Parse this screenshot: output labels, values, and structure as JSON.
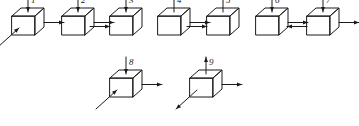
{
  "figure": {
    "background_color": "#ffffff",
    "stroke_color": "#1a1a1a",
    "cube_count": 9,
    "rows": [
      {
        "name": "top-row",
        "cube_indices": [
          0,
          1,
          2,
          3,
          4,
          5,
          6
        ]
      },
      {
        "name": "bottom-row",
        "cube_indices": [
          7,
          8
        ]
      }
    ]
  },
  "cubes": [
    {
      "label": "1",
      "row": "top",
      "position": {
        "x": 12,
        "y": 16
      },
      "top_arrow": {
        "direction": "down",
        "label": "1"
      },
      "right_arrow": {
        "present": true,
        "direction": "out-right"
      },
      "left_arrow": {
        "present": false
      },
      "diagonal_arrow": {
        "present": true,
        "direction": "in-from-lower-left"
      }
    },
    {
      "label": "2",
      "row": "top",
      "position": {
        "x": 62,
        "y": 16
      },
      "top_arrow": {
        "direction": "down",
        "label": "2"
      },
      "right_arrow": {
        "present": true,
        "direction": "out-right"
      },
      "left_arrow": {
        "present": false
      },
      "diagonal_arrow": {
        "present": false
      }
    },
    {
      "label": "3",
      "row": "top",
      "position": {
        "x": 110,
        "y": 16
      },
      "top_arrow": {
        "direction": "down",
        "label": "3"
      },
      "right_arrow": {
        "present": false
      },
      "left_arrow": {
        "present": true,
        "direction": "in-from-left"
      },
      "diagonal_arrow": {
        "present": false
      }
    },
    {
      "label": "4",
      "row": "top",
      "position": {
        "x": 158,
        "y": 16
      },
      "top_arrow": {
        "direction": "up",
        "label": "4"
      },
      "right_arrow": {
        "present": true,
        "direction": "out-right"
      },
      "left_arrow": {
        "present": false
      },
      "diagonal_arrow": {
        "present": false
      }
    },
    {
      "label": "5",
      "row": "top",
      "position": {
        "x": 207,
        "y": 16
      },
      "top_arrow": {
        "direction": "up",
        "label": "5"
      },
      "right_arrow": {
        "present": false
      },
      "left_arrow": {
        "present": true,
        "direction": "in-from-left"
      },
      "diagonal_arrow": {
        "present": false
      }
    },
    {
      "label": "6",
      "row": "top",
      "position": {
        "x": 256,
        "y": 16
      },
      "top_arrow": {
        "direction": "down",
        "label": "6"
      },
      "right_arrow": {
        "present": true,
        "direction": "out-right"
      },
      "left_arrow": {
        "present": false
      },
      "diagonal_arrow": {
        "present": false
      }
    },
    {
      "label": "7",
      "row": "top",
      "position": {
        "x": 307,
        "y": 16
      },
      "top_arrow": {
        "direction": "down",
        "label": "7"
      },
      "right_arrow": {
        "present": true,
        "direction": "out-right"
      },
      "left_arrow": {
        "present": true,
        "direction": "out-left"
      },
      "diagonal_arrow": {
        "present": false
      }
    },
    {
      "label": "8",
      "row": "bottom",
      "position": {
        "x": 110,
        "y": 78
      },
      "top_arrow": {
        "direction": "down",
        "label": "8"
      },
      "right_arrow": {
        "present": true,
        "direction": "out-right"
      },
      "left_arrow": {
        "present": false
      },
      "diagonal_arrow": {
        "present": true,
        "direction": "in-from-lower-left"
      }
    },
    {
      "label": "9",
      "row": "bottom",
      "position": {
        "x": 190,
        "y": 78
      },
      "top_arrow": {
        "direction": "up",
        "label": "9"
      },
      "right_arrow": {
        "present": true,
        "direction": "out-right"
      },
      "left_arrow": {
        "present": false
      },
      "diagonal_arrow": {
        "present": true,
        "direction": "out-to-lower-left"
      }
    }
  ]
}
